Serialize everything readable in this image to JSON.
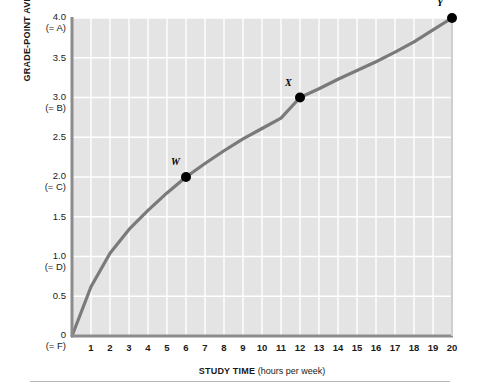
{
  "chart_data": {
    "type": "line",
    "title": "",
    "xlabel_bold": "STUDY TIME",
    "xlabel_rest": " (hours per week)",
    "ylabel": "GRADE-POINT AVERAGE",
    "xlim": [
      0,
      20
    ],
    "ylim": [
      0,
      4.0
    ],
    "grid": true,
    "legend": "none",
    "x_ticks": [
      "1",
      "2",
      "3",
      "4",
      "5",
      "6",
      "7",
      "8",
      "9",
      "10",
      "11",
      "12",
      "13",
      "14",
      "15",
      "16",
      "17",
      "18",
      "19",
      "20"
    ],
    "y_ticks": [
      {
        "value": "4.0",
        "grade": "(= A)"
      },
      {
        "value": "3.5",
        "grade": ""
      },
      {
        "value": "3.0",
        "grade": "(= B)"
      },
      {
        "value": "2.5",
        "grade": ""
      },
      {
        "value": "2.0",
        "grade": "(= C)"
      },
      {
        "value": "1.5",
        "grade": ""
      },
      {
        "value": "1.0",
        "grade": "(= D)"
      },
      {
        "value": "0.5",
        "grade": ""
      },
      {
        "value": "0",
        "grade": "(= F)"
      }
    ],
    "series": [
      {
        "name": "grade-point average vs study time",
        "x": [
          0,
          1,
          2,
          3,
          4,
          5,
          6,
          7,
          8,
          9,
          10,
          11,
          12,
          13,
          14,
          15,
          16,
          17,
          18,
          19,
          20
        ],
        "y": [
          0,
          0.62,
          1.04,
          1.34,
          1.58,
          1.8,
          2.0,
          2.17,
          2.33,
          2.48,
          2.61,
          2.74,
          3.0,
          3.11,
          3.23,
          3.34,
          3.45,
          3.57,
          3.7,
          3.85,
          4.0
        ],
        "color": "#7a7a7a"
      }
    ],
    "points": [
      {
        "label": "W",
        "x": 6,
        "y": 2.0
      },
      {
        "label": "X",
        "x": 12,
        "y": 3.0
      },
      {
        "label": "Y",
        "x": 20,
        "y": 4.0
      }
    ],
    "colors": {
      "plot_background": "#e4e4e4",
      "gridline": "#ffffff",
      "axis": "#8c8c8c",
      "curve": "#7a7a7a",
      "point": "#000000",
      "text": "#1a1a1a"
    }
  }
}
